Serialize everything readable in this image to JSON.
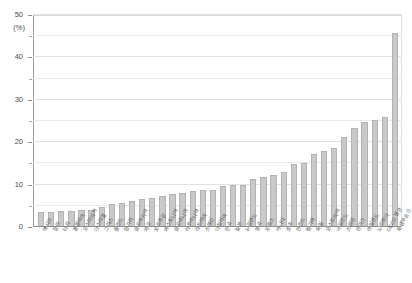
{
  "chart_data": {
    "type": "bar",
    "title": "",
    "subtitle": "",
    "xlabel": "",
    "ylabel": "",
    "unit_label": "(%)",
    "ylim": [
      0,
      50
    ],
    "yticks": [
      0,
      10,
      20,
      30,
      40,
      50
    ],
    "ytick_labels": [
      "0",
      "10",
      "20",
      "30",
      "40",
      "50"
    ],
    "minor_ticks": [
      5,
      15,
      25,
      35,
      45
    ],
    "grid": true,
    "legend": "none",
    "bar_color": "#c9c9c9",
    "bar_edge_color": "#b3b3b3",
    "categories": [
      "멕시코",
      "칠레",
      "터키",
      "콜롬비아",
      "코스타리카",
      "이스라엘",
      "그리스",
      "폴란드",
      "헝가리",
      "슬로바키아",
      "체코",
      "포르투갈",
      "에스토니아",
      "슬로베니아",
      "리투아니아",
      "라트비아",
      "스페인",
      "이탈리아",
      "한국",
      "일본",
      "뉴질랜드",
      "영국",
      "프랑스",
      "캐나다",
      "호주",
      "핀란드",
      "벨기에",
      "독일",
      "오스트리아",
      "네덜란드",
      "스웨덴",
      "덴마크",
      "아일랜드",
      "노르웨이",
      "OECD 평균",
      "룩셈부르크"
    ],
    "values": [
      3.3,
      3.4,
      3.5,
      3.6,
      3.7,
      3.8,
      4.6,
      5.2,
      5.4,
      6.0,
      6.3,
      6.7,
      7.1,
      7.5,
      7.8,
      8.2,
      8.4,
      8.6,
      9.5,
      9.6,
      9.7,
      11.0,
      11.6,
      12.0,
      12.8,
      14.6,
      14.8,
      17.1,
      17.8,
      18.5,
      21.0,
      23.2,
      24.5,
      25.0,
      25.8,
      45.5
    ]
  }
}
